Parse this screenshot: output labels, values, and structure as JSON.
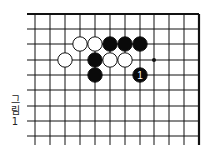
{
  "diagram": {
    "type": "go-board-fragment",
    "caption_chars": [
      "그",
      "림",
      "1"
    ],
    "caption": "그림 1",
    "grid": {
      "x_lines": [
        35,
        50,
        65,
        80,
        95,
        110,
        125,
        140,
        154,
        169,
        184,
        199
      ],
      "y_lines": [
        14,
        29,
        44,
        60,
        75,
        90,
        106,
        121,
        136
      ],
      "top_edge": true,
      "right_edge": true,
      "line_color": "#111111"
    },
    "stones": [
      {
        "color": "white",
        "col": 3,
        "row": 2
      },
      {
        "color": "white",
        "col": 4,
        "row": 2
      },
      {
        "color": "black",
        "col": 5,
        "row": 2
      },
      {
        "color": "black",
        "col": 6,
        "row": 2
      },
      {
        "color": "black",
        "col": 7,
        "row": 2
      },
      {
        "color": "white",
        "col": 2,
        "row": 3
      },
      {
        "color": "black",
        "col": 4,
        "row": 3
      },
      {
        "color": "white",
        "col": 5,
        "row": 3
      },
      {
        "color": "white",
        "col": 6,
        "row": 3
      },
      {
        "color": "black",
        "col": 4,
        "row": 4
      },
      {
        "color": "black",
        "col": 7,
        "row": 4,
        "label": "1"
      }
    ],
    "marks": [
      {
        "type": "dot",
        "col": 8,
        "row": 3
      }
    ]
  }
}
